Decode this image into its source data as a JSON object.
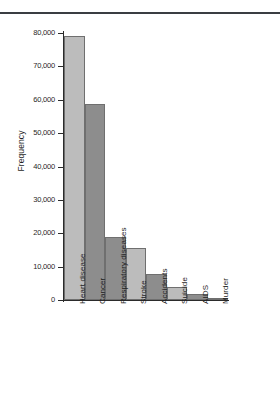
{
  "chart_data": {
    "type": "bar",
    "title": "",
    "xlabel": "",
    "ylabel": "Frequency",
    "categories": [
      "Heart disease",
      "Cancer",
      "Respiratory diseases",
      "Stroke",
      "Accidents",
      "Suicide",
      "AIDS",
      "Murder"
    ],
    "values": [
      79000,
      58800,
      19000,
      15500,
      7800,
      4000,
      1700,
      500
    ],
    "ylim": [
      0,
      80000
    ],
    "yticks": [
      0,
      10000,
      20000,
      30000,
      40000,
      50000,
      60000,
      70000,
      80000
    ],
    "ytick_labels": [
      "0",
      "10,000",
      "20,000",
      "30,000",
      "40,000",
      "50,000",
      "60,000",
      "70,000",
      "80,000"
    ],
    "bar_shades": [
      "light",
      "dark",
      "dark",
      "light",
      "dark",
      "light",
      "dark",
      "dark"
    ],
    "grid": false,
    "legend": null,
    "colors": {
      "bar_light": "#bcbcbc",
      "bar_dark": "#8d8d8d",
      "bar_edge": "#6f6f6f",
      "axis": "#2b2b2b",
      "rule": "#3a3d42",
      "text": "#1f1f1f",
      "background": "#ffffff"
    }
  }
}
